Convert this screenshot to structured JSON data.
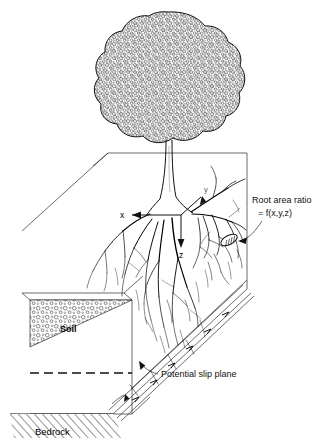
{
  "figure": {
    "background_color": "#ffffff",
    "line_color": "#1a1a1a"
  },
  "labels": {
    "root_area_ratio_line1": "Root area ratio",
    "root_area_ratio_line2": "= f(x,y,z)",
    "potential_slip_plane": "Potential slip plane",
    "soil": "Soil",
    "bedrock": "Bedrock"
  },
  "axes": {
    "x": "x",
    "y": "y",
    "z": "z"
  },
  "elements": {
    "tree_crown": "tree-crown",
    "tree_trunk": "tree-trunk",
    "root_system": "root-system",
    "root_cross_section": "root-cross-section",
    "slope_block": "slope-block",
    "slip_plane_band": "slip-plane-band",
    "bedrock_hatching": "bedrock-hatching",
    "soil_stipple": "soil-stipple",
    "water_table_dashed": "water-table-dashed-line"
  }
}
